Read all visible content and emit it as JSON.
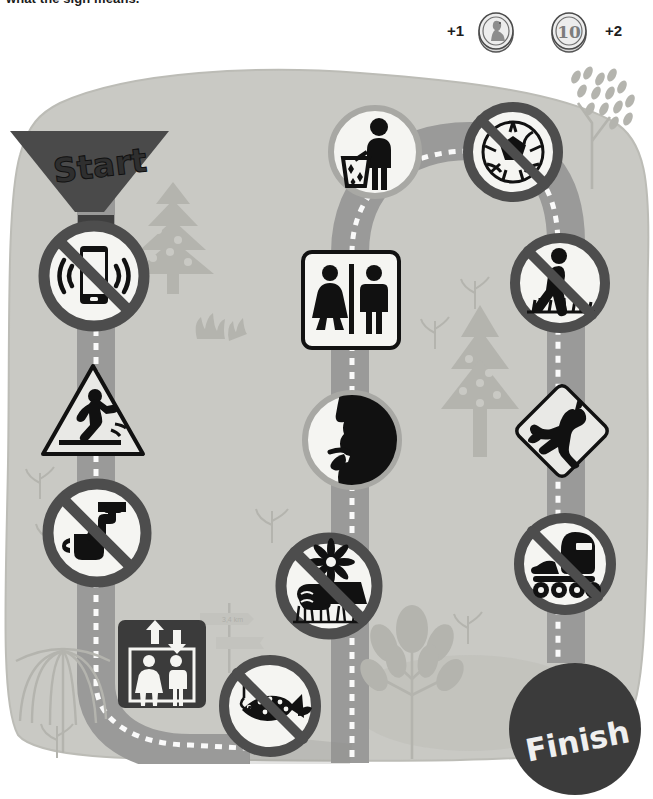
{
  "header": {
    "instruction": "what the sign means."
  },
  "scoring": {
    "coins": [
      {
        "name": "coin-head",
        "face": "head-profile",
        "points": "+1"
      },
      {
        "name": "coin-ten",
        "face": "10",
        "points": "+2"
      }
    ]
  },
  "board": {
    "start_label": "Start",
    "finish_label": "Finish",
    "signpost_text": "3,4 km",
    "colors": {
      "grass": "#c9c9c4",
      "path": "#9a9a99",
      "prohibition_ring": "#6b6b6b",
      "sign_face": "#f5f5f2",
      "pictogram": "#111111",
      "start_banner": "#4a4a4a",
      "finish_disc": "#3b3b3b",
      "tree": "#b4b4ae"
    },
    "signs": [
      {
        "id": "no-mobile-phones",
        "label": "No mobile phones",
        "shape": "prohibition",
        "x": 36,
        "y": 218,
        "size": 116
      },
      {
        "id": "slippery-surface-warning",
        "label": "Warning slippery wet floor",
        "shape": "warning-triangle",
        "x": 37,
        "y": 360,
        "size": 108
      },
      {
        "id": "no-drinking-water",
        "label": "Not drinking water",
        "shape": "prohibition",
        "x": 40,
        "y": 476,
        "size": 114
      },
      {
        "id": "elevator",
        "label": "Lift / elevator",
        "shape": "square",
        "x": 116,
        "y": 618,
        "size": 92
      },
      {
        "id": "no-fishing",
        "label": "No fishing",
        "shape": "prohibition",
        "x": 216,
        "y": 652,
        "size": 108
      },
      {
        "id": "no-picking-flowers",
        "label": "Do not pick the flowers",
        "shape": "prohibition",
        "x": 273,
        "y": 530,
        "size": 112
      },
      {
        "id": "silence",
        "label": "Silence please",
        "shape": "circle",
        "x": 300,
        "y": 388,
        "size": 104
      },
      {
        "id": "toilets",
        "label": "Toilets",
        "shape": "square",
        "x": 301,
        "y": 250,
        "size": 100
      },
      {
        "id": "use-litter-bin",
        "label": "Put litter in the bin",
        "shape": "circle",
        "x": 327,
        "y": 104,
        "size": 96
      },
      {
        "id": "no-ball-games",
        "label": "No ball games",
        "shape": "prohibition",
        "x": 461,
        "y": 100,
        "size": 104
      },
      {
        "id": "keep-off-the-grass",
        "label": "Keep off the grass",
        "shape": "prohibition",
        "x": 507,
        "y": 230,
        "size": 106
      },
      {
        "id": "kangaroo-crossing",
        "label": "Kangaroo crossing",
        "shape": "diamond",
        "x": 511,
        "y": 380,
        "size": 102
      },
      {
        "id": "no-rollerblading",
        "label": "No rollerblading",
        "shape": "prohibition",
        "x": 511,
        "y": 510,
        "size": 108
      }
    ],
    "scenery": [
      {
        "id": "conifer-tree-left",
        "label": "Fir tree",
        "x": 130,
        "y": 185
      },
      {
        "id": "shrub-left",
        "label": "Shrub",
        "x": 195,
        "y": 245
      },
      {
        "id": "conifer-tree-middle",
        "label": "Fir tree",
        "x": 440,
        "y": 310
      },
      {
        "id": "willow-tree-bottom-left",
        "label": "Willow tree",
        "x": 20,
        "y": 610
      },
      {
        "id": "broadleaf-tree-bottom",
        "label": "Leafy tree",
        "x": 375,
        "y": 590
      },
      {
        "id": "blossom-tree-top-right",
        "label": "Blossom tree",
        "x": 565,
        "y": 70
      },
      {
        "id": "direction-signpost",
        "label": "Direction signpost",
        "x": 195,
        "y": 540
      }
    ]
  }
}
